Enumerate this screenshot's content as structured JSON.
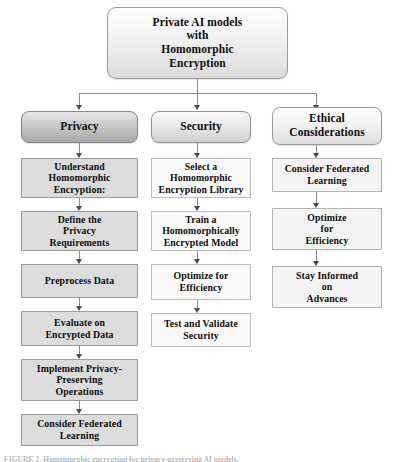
{
  "figure": {
    "type": "flowchart",
    "orientation": "top-down",
    "background_color": "#ffffff",
    "connector_color": "#8c8c8c",
    "arrowhead_color": "#4a4a4a"
  },
  "root": {
    "label": "Private AI models\nwith\nHomomorphic\nEncryption",
    "shape": "rounded-rectangle",
    "fill": "#f2f2f2"
  },
  "columns": [
    {
      "id": "privacy",
      "header": {
        "label": "Privacy",
        "shade": "shade-dark",
        "fill": "#a8a8a8"
      },
      "step_fill": "fill-gray",
      "steps": [
        {
          "label": "Understand\nHomomorphic\nEncryption:"
        },
        {
          "label": "Define the\nPrivacy\nRequirements"
        },
        {
          "label": "Preprocess Data"
        },
        {
          "label": "Evaluate on\nEncrypted Data"
        },
        {
          "label": "Implement Privacy-\nPreserving\nOperations"
        },
        {
          "label": "Consider Federated\nLearning"
        }
      ]
    },
    {
      "id": "security",
      "header": {
        "label": "Security",
        "shade": "shade-mid",
        "fill": "#ececec"
      },
      "step_fill": "fill-white",
      "steps": [
        {
          "label": "Select a\nHomomorphic\nEncryption Library"
        },
        {
          "label": "Train a\nHomomorphically\nEncrypted Model"
        },
        {
          "label": "Optimize for\nEfficiency"
        },
        {
          "label": "Test and Validate\nSecurity"
        }
      ]
    },
    {
      "id": "ethical-considerations",
      "header": {
        "label": "Ethical\nConsiderations",
        "shade": "shade-light",
        "fill": "#f4f4f4"
      },
      "step_fill": "fill-pale",
      "steps": [
        {
          "label": "Consider Federated\nLearning"
        },
        {
          "label": "Optimize\nfor\nEfficiency"
        },
        {
          "label": "Stay Informed\non\nAdvances"
        }
      ]
    }
  ],
  "caption": {
    "text": "FIGURE 2.  Homomorphic encryption for privacy-preserving AI models."
  }
}
